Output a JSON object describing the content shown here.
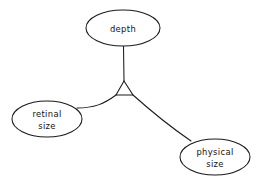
{
  "diagram": {
    "background_color": "#ffffff",
    "stroke_color": "#1a1a1a",
    "text_color": "#111111",
    "nodes": [
      {
        "id": "depth",
        "label": "depth",
        "lines": [
          "depth"
        ],
        "shape": "ellipse",
        "cx": 123,
        "cy": 28,
        "rx": 37,
        "ry": 18
      },
      {
        "id": "retinal-size",
        "label": "retinal size",
        "lines": [
          "retinal",
          "size"
        ],
        "shape": "ellipse",
        "cx": 47,
        "cy": 119,
        "rx": 35,
        "ry": 18
      },
      {
        "id": "physical-size",
        "label": "physical size",
        "lines": [
          "physical",
          "size"
        ],
        "shape": "ellipse",
        "cx": 215,
        "cy": 157,
        "rx": 35,
        "ry": 18
      }
    ],
    "junction": {
      "id": "junction-triangle",
      "shape": "triangle",
      "apex_x": 124,
      "apex_y": 81,
      "base_left_x": 116,
      "base_left_y": 95,
      "base_right_x": 133,
      "base_right_y": 95
    },
    "links": [
      {
        "id": "link-depth",
        "from": "depth",
        "to": "junction-triangle",
        "path": "M 123.5 46 L 124 81"
      },
      {
        "id": "link-retinal",
        "from": "junction-triangle",
        "to": "retinal-size",
        "path": "M 116 95 C 104 104 94 108 77 108"
      },
      {
        "id": "link-physical",
        "from": "junction-triangle",
        "to": "physical-size",
        "path": "M 133 95 C 152 112 172 128 191 141"
      }
    ]
  }
}
